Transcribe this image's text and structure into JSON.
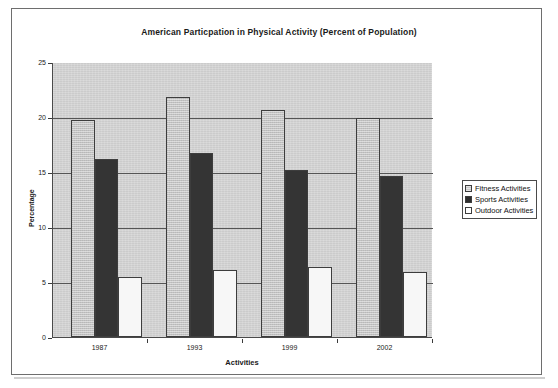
{
  "chart_data": {
    "type": "bar",
    "title": "American Particpation in Physical Activity (Percent of Population)",
    "xlabel": "Activities",
    "ylabel": "Percentage",
    "categories": [
      "1987",
      "1993",
      "1999",
      "2002"
    ],
    "series": [
      {
        "name": "Fitness Activities",
        "values": [
          19.7,
          21.8,
          20.6,
          19.9
        ],
        "color": "#c2c2c2"
      },
      {
        "name": "Sports Activities",
        "values": [
          16.2,
          16.7,
          15.2,
          14.6
        ],
        "color": "#343434"
      },
      {
        "name": "Outdoor Activities",
        "values": [
          5.5,
          6.1,
          6.4,
          5.9
        ],
        "color": "#f7f7f7"
      }
    ],
    "ylim": [
      0,
      25
    ],
    "yticks": [
      "0",
      "5",
      "10",
      "15",
      "20",
      "25"
    ],
    "grid": true,
    "legend_position": "right",
    "plot_background": "#d2d2d2"
  }
}
